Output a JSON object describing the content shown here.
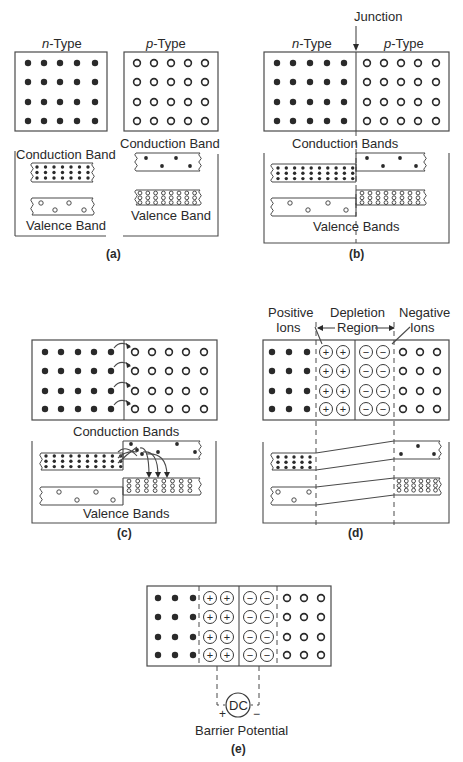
{
  "figure": {
    "panels": [
      {
        "id": "a",
        "caption": "(a)",
        "labels": {
          "n_type": "n-Type",
          "p_type": "p-Type",
          "n_conduction": "Conduction Band",
          "n_valence": "Valence Band",
          "p_conduction": "Conduction Band",
          "p_valence": "Valence Band"
        }
      },
      {
        "id": "b",
        "caption": "(b)",
        "labels": {
          "junction": "Junction",
          "n_type": "n-Type",
          "p_type": "p-Type",
          "conduction": "Conduction Bands",
          "valence": "Valence Bands"
        }
      },
      {
        "id": "c",
        "caption": "(c)",
        "labels": {
          "conduction": "Conduction Bands",
          "valence": "Valence Bands"
        }
      },
      {
        "id": "d",
        "caption": "(d)",
        "labels": {
          "positive_ions_1": "Positive",
          "positive_ions_2": "Ions",
          "depletion_1": "Depletion",
          "depletion_2": "Region",
          "negative_ions_1": "Negative",
          "negative_ions_2": "Ions"
        }
      },
      {
        "id": "e",
        "caption": "(e)",
        "labels": {
          "source": "DC",
          "plus": "+",
          "minus": "−",
          "barrier": "Barrier Potential"
        }
      }
    ],
    "symbols": {
      "plus": "+",
      "minus": "−"
    }
  }
}
